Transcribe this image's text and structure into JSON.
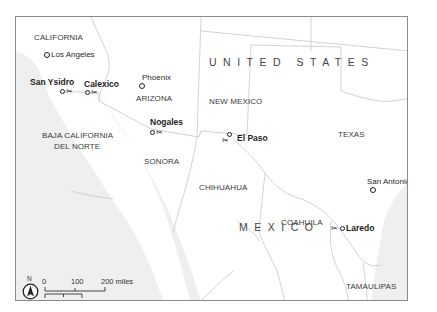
{
  "map": {
    "title": "US-Mexico border crossings",
    "colors": {
      "land": "#ffffff",
      "ocean": "#efefef",
      "border": "#c8c8c8",
      "frame": "#8a8a8a",
      "text": "#333333"
    },
    "countries": [
      {
        "label": "UNITED STATES"
      },
      {
        "label": "MEXICO"
      }
    ],
    "states": [
      {
        "label": "CALIFORNIA"
      },
      {
        "label": "ARIZONA"
      },
      {
        "label": "NEW MEXICO"
      },
      {
        "label": "TEXAS"
      },
      {
        "label": "BAJA CALIFORNIA"
      },
      {
        "label": "DEL NORTE"
      },
      {
        "label": "SONORA"
      },
      {
        "label": "CHIHUAHUA"
      },
      {
        "label": "COAHUILA"
      },
      {
        "label": "TAMAULIPAS"
      }
    ],
    "cities": [
      {
        "label": "Los Angeles"
      },
      {
        "label": "Phoenix"
      },
      {
        "label": "San Antonio"
      }
    ],
    "crossings": [
      {
        "label": "San Ysidro",
        "icon": "scissors-icon"
      },
      {
        "label": "Calexico",
        "icon": "scissors-icon"
      },
      {
        "label": "Nogales",
        "icon": "scissors-icon"
      },
      {
        "label": "El Paso",
        "icon": "scissors-icon"
      },
      {
        "label": "Laredo",
        "icon": "scissors-icon"
      }
    ],
    "scale": {
      "miles": {
        "ticks": [
          "0",
          "100",
          "200 miles"
        ]
      },
      "km": {
        "ticks": [
          "0",
          "100",
          "200 kilometers"
        ]
      }
    },
    "compass": {
      "label": "N",
      "icon": "north-arrow-icon"
    }
  }
}
